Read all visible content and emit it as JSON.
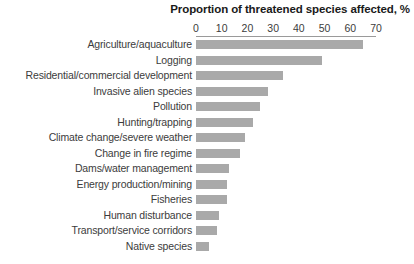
{
  "chart_data": {
    "type": "bar",
    "orientation": "horizontal",
    "title": "Proportion of threatened species affected, %",
    "xlabel": "",
    "ylabel": "",
    "xlim": [
      0,
      70
    ],
    "xticks": [
      0,
      10,
      20,
      30,
      40,
      50,
      60,
      70
    ],
    "xtick_labels": [
      "0",
      "10",
      "20",
      "30",
      "40",
      "50",
      "60",
      "70"
    ],
    "grid": false,
    "legend": "none",
    "bar_color": "#a9a9a9",
    "axis_color": "#9a9a9a",
    "text_color": "#3c3c3c",
    "categories": [
      "Agriculture/aquaculture",
      "Logging",
      "Residential/commercial development",
      "Invasive alien species",
      "Pollution",
      "Hunting/trapping",
      "Climate change/severe weather",
      "Change in fire regime",
      "Dams/water management",
      "Energy production/mining",
      "Fisheries",
      "Human disturbance",
      "Transport/service corridors",
      "Native species"
    ],
    "values": [
      65,
      49,
      34,
      28,
      25,
      22,
      19,
      17,
      13,
      12,
      12,
      9,
      8,
      5
    ]
  }
}
